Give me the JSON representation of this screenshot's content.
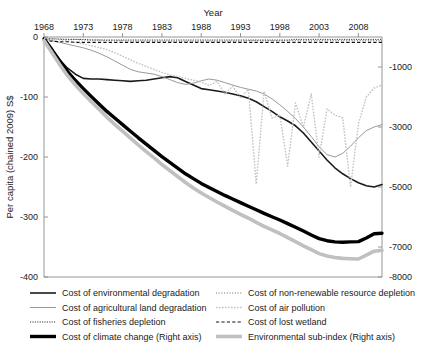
{
  "chart_data": {
    "type": "line",
    "title": "",
    "xlabel": "Year",
    "ylabel": "Per capita (chained 2009) S$",
    "ylabel_right": "",
    "grid": false,
    "x_axis_position": "top",
    "legend_position": "bottom",
    "xlim": [
      1968,
      2011
    ],
    "ylim": [
      -400,
      0
    ],
    "ylim_right": [
      -8000,
      0
    ],
    "xticks": [
      "1968",
      "1973",
      "1978",
      "1983",
      "1988",
      "1993",
      "1998",
      "2003",
      "2008"
    ],
    "xtick_values": [
      1968,
      1973,
      1978,
      1983,
      1988,
      1993,
      1998,
      2003,
      2008
    ],
    "yticks_left": [
      "0",
      "-100",
      "-200",
      "-300",
      "-400"
    ],
    "ytick_values_left": [
      0,
      -100,
      -200,
      -300,
      -400
    ],
    "yticks_right": [
      "-1000",
      "-3000",
      "-5000",
      "-7000",
      "-8000"
    ],
    "ytick_values_right": [
      -1000,
      -3000,
      -5000,
      -7000,
      -8000
    ],
    "x": [
      1968,
      1969,
      1970,
      1971,
      1972,
      1973,
      1974,
      1975,
      1976,
      1977,
      1978,
      1979,
      1980,
      1981,
      1982,
      1983,
      1984,
      1985,
      1986,
      1987,
      1988,
      1989,
      1990,
      1991,
      1992,
      1993,
      1994,
      1995,
      1996,
      1997,
      1998,
      1999,
      2000,
      2001,
      2002,
      2003,
      2004,
      2005,
      2006,
      2007,
      2008,
      2009,
      2010,
      2011
    ],
    "series": [
      {
        "name": "Cost of environmental degradation",
        "axis": "left",
        "style": "solid",
        "color": "#1a1a1a",
        "width": 1.6,
        "values": [
          -2,
          -20,
          -38,
          -52,
          -62,
          -69,
          -70,
          -70,
          -71,
          -72,
          -73,
          -74,
          -73,
          -72,
          -70,
          -68,
          -66,
          -68,
          -74,
          -80,
          -86,
          -88,
          -90,
          -92,
          -95,
          -98,
          -102,
          -108,
          -116,
          -124,
          -133,
          -140,
          -148,
          -160,
          -175,
          -190,
          -205,
          -218,
          -228,
          -236,
          -243,
          -248,
          -250,
          -246
        ]
      },
      {
        "name": "Cost of agricultural land degradation",
        "axis": "left",
        "style": "solid-thin",
        "color": "#8c8c8c",
        "width": 0.9,
        "values": [
          -3,
          -6,
          -9,
          -12,
          -15,
          -18,
          -22,
          -27,
          -33,
          -40,
          -47,
          -54,
          -58,
          -60,
          -62,
          -66,
          -71,
          -76,
          -79,
          -77,
          -73,
          -70,
          -72,
          -76,
          -80,
          -84,
          -87,
          -90,
          -95,
          -103,
          -113,
          -124,
          -136,
          -150,
          -166,
          -183,
          -196,
          -200,
          -194,
          -182,
          -168,
          -156,
          -150,
          -146
        ]
      },
      {
        "name": "Cost of fisheries depletion",
        "axis": "left",
        "style": "dotted-dense",
        "color": "#3a3a3a",
        "width": 1.0,
        "values": [
          -3,
          -3,
          -4,
          -4,
          -4,
          -4,
          -5,
          -5,
          -5,
          -5,
          -5,
          -5,
          -5,
          -5,
          -5,
          -5,
          -5,
          -5,
          -5,
          -5,
          -5,
          -5,
          -5,
          -5,
          -5,
          -5,
          -5,
          -5,
          -5,
          -5,
          -5,
          -5,
          -4,
          -4,
          -4,
          -4,
          -4,
          -4,
          -4,
          -4,
          -4,
          -4,
          -4,
          -4
        ]
      },
      {
        "name": "Cost of climate change (Right axis)",
        "axis": "right",
        "style": "solid-thick",
        "color": "#000000",
        "width": 3.4,
        "values": [
          -60,
          -420,
          -800,
          -1150,
          -1450,
          -1720,
          -1980,
          -2230,
          -2480,
          -2700,
          -2920,
          -3140,
          -3360,
          -3570,
          -3780,
          -3990,
          -4180,
          -4370,
          -4560,
          -4720,
          -4880,
          -5020,
          -5150,
          -5280,
          -5400,
          -5520,
          -5640,
          -5760,
          -5880,
          -5990,
          -6100,
          -6220,
          -6340,
          -6470,
          -6600,
          -6720,
          -6790,
          -6830,
          -6840,
          -6830,
          -6820,
          -6700,
          -6560,
          -6540
        ]
      },
      {
        "name": "Cost of non-renewable resource depletion",
        "axis": "left",
        "style": "dotted-fine",
        "color": "#4a4a4a",
        "width": 0.9,
        "values": [
          -2,
          -3,
          -3,
          -4,
          -4,
          -5,
          -5,
          -5,
          -6,
          -6,
          -6,
          -7,
          -7,
          -7,
          -7,
          -7,
          -7,
          -7,
          -7,
          -7,
          -7,
          -7,
          -7,
          -7,
          -7,
          -7,
          -6,
          -6,
          -6,
          -6,
          -6,
          -6,
          -6,
          -6,
          -6,
          -6,
          -6,
          -6,
          -6,
          -6,
          -6,
          -6,
          -6,
          -6
        ]
      },
      {
        "name": "Cost of air pollution",
        "axis": "right",
        "style": "dotted-light",
        "color": "#c2c2c2",
        "width": 1.4,
        "values": [
          -40,
          -60,
          -90,
          -130,
          -180,
          -230,
          -290,
          -350,
          -420,
          -520,
          -640,
          -760,
          -880,
          -980,
          -1080,
          -1180,
          -1260,
          -1320,
          -1380,
          -1440,
          -1500,
          -1620,
          -1480,
          -1900,
          -1640,
          -2040,
          -1740,
          -4900,
          -1800,
          -2700,
          -2600,
          -4300,
          -2200,
          -3000,
          -1900,
          -4000,
          -2400,
          -2600,
          -2700,
          -5000,
          -2900,
          -2000,
          -1700,
          -1600
        ]
      },
      {
        "name": "Cost of lost wetland",
        "axis": "left",
        "style": "dashed",
        "color": "#111111",
        "width": 1.1,
        "values": [
          -6,
          -7,
          -8,
          -8,
          -9,
          -9,
          -9,
          -9,
          -9,
          -9,
          -9,
          -9,
          -9,
          -9,
          -9,
          -9,
          -9,
          -9,
          -9,
          -9,
          -9,
          -9,
          -9,
          -9,
          -9,
          -9,
          -9,
          -9,
          -9,
          -9,
          -9,
          -9,
          -9,
          -9,
          -9,
          -9,
          -9,
          -9,
          -9,
          -9,
          -9,
          -9,
          -9,
          -9
        ]
      },
      {
        "name": "Environmental sub-index (Right axis)",
        "axis": "right",
        "style": "solid-thick-gray",
        "color": "#c0c0c0",
        "width": 3.6,
        "values": [
          -120,
          -520,
          -920,
          -1290,
          -1600,
          -1880,
          -2150,
          -2410,
          -2670,
          -2910,
          -3140,
          -3370,
          -3600,
          -3820,
          -4030,
          -4250,
          -4450,
          -4650,
          -4850,
          -5030,
          -5200,
          -5350,
          -5500,
          -5640,
          -5780,
          -5910,
          -6040,
          -6180,
          -6310,
          -6430,
          -6550,
          -6690,
          -6820,
          -6960,
          -7090,
          -7220,
          -7300,
          -7350,
          -7380,
          -7390,
          -7400,
          -7270,
          -7140,
          -7110
        ]
      }
    ]
  },
  "legend": {
    "entries_left": [
      {
        "label": "Cost of environmental degradation"
      },
      {
        "label": "Cost of agricultural land degradation"
      },
      {
        "label": "Cost of fisheries depletion"
      },
      {
        "label": "Cost of climate change (Right axis)"
      }
    ],
    "entries_right": [
      {
        "label": "Cost of non-renewable resource depletion"
      },
      {
        "label": "Cost of air pollution"
      },
      {
        "label": "Cost of lost wetland"
      },
      {
        "label": "Environmental sub-index (Right axis)"
      }
    ]
  }
}
